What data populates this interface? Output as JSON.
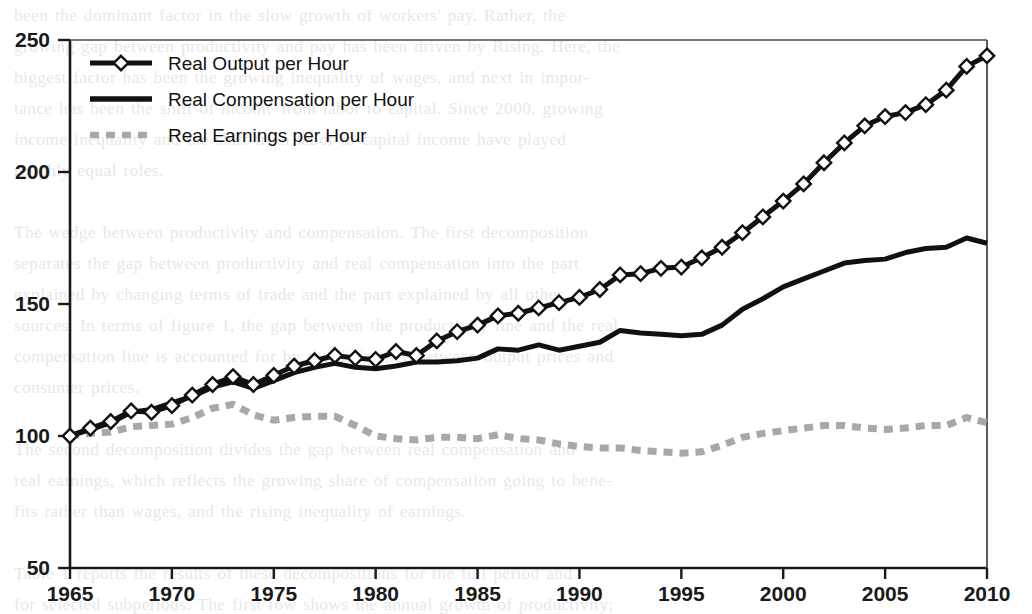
{
  "chart_data": {
    "type": "line",
    "title": "",
    "xlabel": "",
    "ylabel": "",
    "xlim": [
      1965,
      2010
    ],
    "ylim": [
      50,
      250
    ],
    "grid": false,
    "legend_position": "top-left",
    "index_base": "1965 = 100",
    "x_ticks": [
      "1965",
      "1970",
      "1975",
      "1980",
      "1985",
      "1990",
      "1995",
      "2000",
      "2005",
      "2010"
    ],
    "y_ticks": [
      "50",
      "100",
      "150",
      "200",
      "250"
    ],
    "x": [
      1965,
      1966,
      1967,
      1968,
      1969,
      1970,
      1971,
      1972,
      1973,
      1974,
      1975,
      1976,
      1977,
      1978,
      1979,
      1980,
      1981,
      1982,
      1983,
      1984,
      1985,
      1986,
      1987,
      1988,
      1989,
      1990,
      1991,
      1992,
      1993,
      1994,
      1995,
      1996,
      1997,
      1998,
      1999,
      2000,
      2001,
      2002,
      2003,
      2004,
      2005,
      2006,
      2007,
      2008,
      2009,
      2010
    ],
    "series": [
      {
        "name": "Real Output per Hour",
        "marker": "diamond",
        "style": "solid",
        "color": "#111111",
        "values": [
          100.0,
          103.0,
          105.5,
          109.5,
          109.0,
          111.5,
          115.5,
          119.5,
          122.5,
          119.5,
          123.0,
          126.5,
          128.5,
          130.5,
          129.5,
          129.0,
          132.0,
          130.5,
          136.0,
          139.5,
          142.0,
          145.5,
          146.5,
          148.5,
          150.5,
          152.5,
          155.5,
          161.0,
          161.5,
          163.5,
          164.0,
          167.5,
          171.5,
          177.0,
          183.0,
          189.0,
          195.5,
          203.5,
          211.0,
          217.5,
          221.0,
          222.5,
          225.5,
          231.0,
          240.0,
          244.0
        ]
      },
      {
        "name": "Real Compensation per Hour",
        "marker": "none",
        "style": "solid",
        "color": "#111111",
        "values": [
          100.0,
          102.5,
          105.0,
          109.0,
          110.0,
          112.5,
          115.0,
          118.5,
          120.5,
          118.0,
          121.0,
          124.0,
          126.0,
          127.5,
          126.0,
          125.5,
          126.5,
          128.0,
          128.0,
          128.5,
          129.5,
          133.0,
          132.5,
          134.5,
          132.5,
          134.0,
          135.5,
          140.0,
          139.0,
          138.5,
          138.0,
          138.5,
          142.0,
          148.0,
          152.0,
          156.5,
          159.5,
          162.5,
          165.5,
          166.5,
          167.0,
          169.5,
          171.0,
          171.5,
          175.0,
          173.0
        ]
      },
      {
        "name": "Real Earnings per Hour",
        "marker": "none",
        "style": "dashed",
        "color": "#a8a8a8",
        "values": [
          100.0,
          101.0,
          101.5,
          103.5,
          104.0,
          104.5,
          107.0,
          110.5,
          112.0,
          108.0,
          106.0,
          107.0,
          107.5,
          107.5,
          104.0,
          100.0,
          99.0,
          98.5,
          99.5,
          99.5,
          99.0,
          100.5,
          99.0,
          98.5,
          97.0,
          96.0,
          95.5,
          95.5,
          94.5,
          94.0,
          93.5,
          94.0,
          96.5,
          99.5,
          101.0,
          102.0,
          103.0,
          104.0,
          104.0,
          103.0,
          102.5,
          103.0,
          104.0,
          104.0,
          107.0,
          105.0
        ]
      }
    ]
  },
  "legend": {
    "items": [
      {
        "label": "Real Output per Hour",
        "swatch": "line-diamond-swatch"
      },
      {
        "label": "Real Compensation per Hour",
        "swatch": "line-solid-swatch"
      },
      {
        "label": "Real Earnings per Hour",
        "swatch": "line-dashed-swatch"
      }
    ]
  },
  "background_page_text": "been the dominant factor in the slow growth of workers' pay. Rather, the\ngrowing gap between productivity and pay has been driven by Rising. Here, the\nbiggest factor has been the growing inequality of wages, and next in impor-\ntance has been the shift of income from labor to capital. Since 2000, growing\nincome inequality and the shift from labor to capital income have played\nroughly equal roles.\n\nThe wedge between productivity and compensation. The first decomposition\nseparates the gap between productivity and real compensation into the part\nexplained by changing terms of trade and the part explained by all other\nsources. In terms of figure 1, the gap between the productivity line and the real\ncompensation line is accounted for by the difference between output prices and\nconsumer prices.\n\nThe second decomposition divides the gap between real compensation and\nreal earnings, which reflects the growing share of compensation going to bene-\nfits rather than wages, and the rising inequality of earnings.\n\nTable 1 reports the results of these decompositions for the full period and\nfor selected subperiods. The first row shows the annual growth of productivity;\nthe second row shows real hourly compensation growth."
}
